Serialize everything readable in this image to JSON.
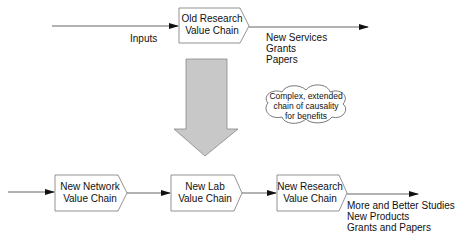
{
  "top": {
    "box": {
      "line1": "Old Research",
      "line2": "Value Chain"
    },
    "input_label": "Inputs",
    "outputs": [
      "New Services",
      "Grants",
      "Papers"
    ]
  },
  "cloud": {
    "lines": [
      "Complex, extended",
      "chain of causality",
      "for benefits"
    ]
  },
  "bottom": {
    "boxes": [
      {
        "line1": "New Network",
        "line2": "Value Chain"
      },
      {
        "line1": "New Lab",
        "line2": "Value Chain"
      },
      {
        "line1": "New Research",
        "line2": "Value Chain"
      }
    ],
    "outputs": [
      "More and Better Studies",
      "New Products",
      "Grants and Papers"
    ]
  },
  "colors": {
    "line": "#555555",
    "big_arrow_fill": "#c8c8c8",
    "box_border": "#777777"
  }
}
